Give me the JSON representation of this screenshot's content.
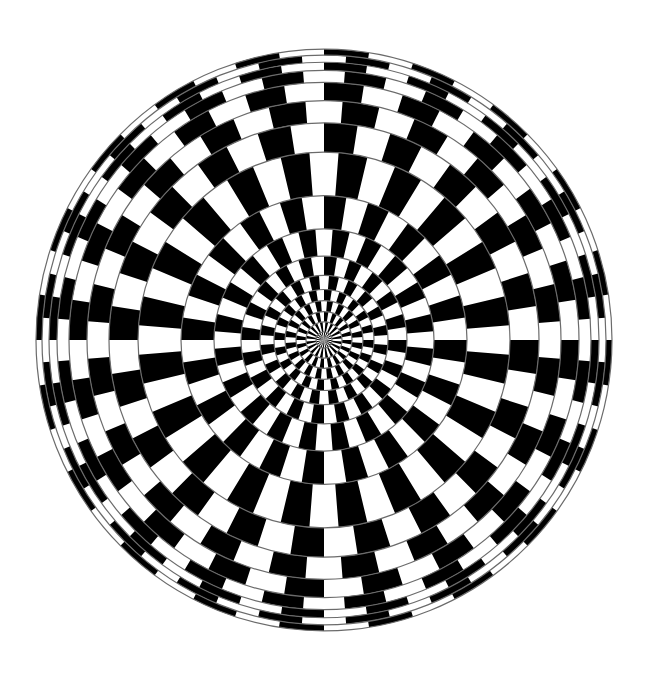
{
  "title": "Radial checkerboard optical illusion",
  "canvas": {
    "width": 646,
    "height": 684,
    "background": "#ffffff"
  },
  "figure": {
    "center": {
      "x": 324,
      "y": 340
    },
    "scale_x": 1.0,
    "scale_y": 1.01,
    "segments": 40,
    "ring_radii": [
      0,
      8,
      18,
      28,
      39,
      50,
      64,
      83,
      110,
      143,
      186,
      215,
      237,
      255,
      267,
      275,
      282,
      288
    ],
    "colors": {
      "dark": "#000000",
      "light": "#ffffff",
      "ring_line": "#6b6b6b"
    },
    "ring_line_width": 1.2,
    "offset_alternate_rings": true
  }
}
